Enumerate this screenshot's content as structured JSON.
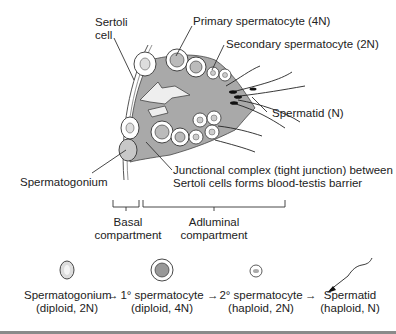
{
  "diagram": {
    "title_labels": {
      "sertoli": [
        "Sertoli",
        "cell"
      ],
      "primary": "Primary spermatocyte (4N)",
      "secondary": "Secondary spermatocyte (2N)",
      "spermatid": "Spermatid (N)",
      "spermatogonium": "Spermatogonium",
      "junctional": [
        "Junctional complex (tight junction) between",
        "Sertoli cells forms blood-testis barrier"
      ]
    },
    "compartments": {
      "basal": [
        "Basal",
        "compartment"
      ],
      "adluminal": [
        "Adluminal",
        "compartment"
      ]
    },
    "sequence": [
      {
        "name": "Spermatogonium",
        "detail": "(diploid, 2N)"
      },
      {
        "name": "1° spermatocyte",
        "detail": "(diploid, 4N)"
      },
      {
        "name": "2° spermatocyte",
        "detail": "(haploid, 2N)"
      },
      {
        "name": "Spermatid",
        "detail": "(haploid, N)"
      }
    ],
    "arrow": "→",
    "colors": {
      "sertoli_fill": "#a9a9a9",
      "cell_fill": "#ffffff",
      "line": "#333333",
      "rule": "#8a8a8a"
    }
  }
}
